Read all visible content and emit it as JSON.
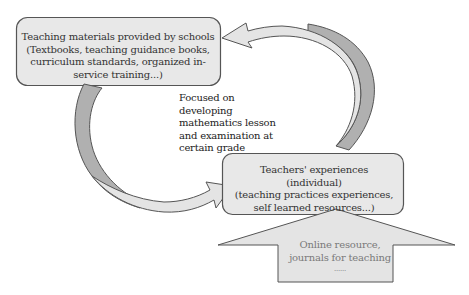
{
  "diagram": {
    "colors": {
      "box_fill": "#e8e8e8",
      "box_stroke": "#555555",
      "arrow_light_fill": "#e4e4e4",
      "arrow_dark_fill": "#b0b0b0",
      "text_dark": "#333333",
      "text_muted": "#7a7a7a"
    },
    "top_box": {
      "lines": [
        "Teaching materials provided by schools",
        "(Textbooks, teaching guidance books,",
        "curriculum standards, organized in-",
        "service training...)"
      ]
    },
    "focus_note": {
      "lines": [
        "Focused on",
        "developing",
        "mathematics lesson",
        "and examination at",
        "certain grade"
      ]
    },
    "bottom_box": {
      "lines": [
        "Teachers' experiences",
        "(individual)",
        "(teaching practices experiences,",
        "self learned resources...)"
      ]
    },
    "input_arrow": {
      "lines": [
        "Online resource,",
        "journals for teaching",
        "......"
      ]
    },
    "arrows": [
      {
        "name": "curved-arrow-experiences-to-materials",
        "direction": "from bottom box up and over to top box (points left)"
      },
      {
        "name": "curved-arrow-materials-to-experiences",
        "direction": "from top box down and around to bottom box (points right)"
      },
      {
        "name": "block-arrow-online-to-experiences",
        "direction": "up into bottom box"
      }
    ]
  }
}
